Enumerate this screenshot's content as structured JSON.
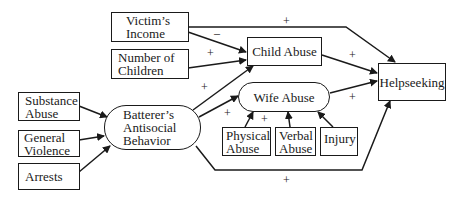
{
  "diagram": {
    "type": "path-model",
    "nodes": {
      "victims_income": {
        "line1": "Victim’s",
        "line2": "Income"
      },
      "number_of_children": {
        "line1": "Number of",
        "line2": "Children"
      },
      "child_abuse": {
        "label": "Child Abuse"
      },
      "helpseeking": {
        "label": "Helpseeking"
      },
      "wife_abuse": {
        "label": "Wife Abuse"
      },
      "substance_abuse": {
        "line1": "Substance",
        "line2": "Abuse"
      },
      "general_violence": {
        "line1": "General",
        "line2": "Violence"
      },
      "arrests": {
        "label": "Arrests"
      },
      "batterers_antisocial_behavior": {
        "line1": "Batterer’s",
        "line2": "Antisocial",
        "line3": "Behavior"
      },
      "physical_abuse": {
        "line1": "Physical",
        "line2": "Abuse"
      },
      "verbal_abuse": {
        "line1": "Verbal",
        "line2": "Abuse"
      },
      "injury": {
        "label": "Injury"
      }
    },
    "edges": [
      {
        "from": "Victim's Income",
        "to": "Helpseeking",
        "sign": "+"
      },
      {
        "from": "Victim's Income",
        "to": "Child Abuse",
        "sign": "–"
      },
      {
        "from": "Number of Children",
        "to": "Child Abuse",
        "sign": "+"
      },
      {
        "from": "Batterer's Antisocial Behavior",
        "to": "Child Abuse",
        "sign": "+"
      },
      {
        "from": "Batterer's Antisocial Behavior",
        "to": "Wife Abuse",
        "sign": "+"
      },
      {
        "from": "Batterer's Antisocial Behavior",
        "to": "Helpseeking",
        "sign": "+"
      },
      {
        "from": "Child Abuse",
        "to": "Helpseeking",
        "sign": "+"
      },
      {
        "from": "Wife Abuse",
        "to": "Helpseeking",
        "sign": "+"
      },
      {
        "from": "Substance Abuse",
        "to": "Batterer's Antisocial Behavior",
        "sign": ""
      },
      {
        "from": "General Violence",
        "to": "Batterer's Antisocial Behavior",
        "sign": ""
      },
      {
        "from": "Arrests",
        "to": "Batterer's Antisocial Behavior",
        "sign": ""
      },
      {
        "from": "Physical Abuse",
        "to": "Wife Abuse",
        "sign": "+"
      },
      {
        "from": "Verbal Abuse",
        "to": "Wife Abuse",
        "sign": ""
      },
      {
        "from": "Injury",
        "to": "Wife Abuse",
        "sign": ""
      }
    ],
    "signs": {
      "income_help": "+",
      "income_child": "–",
      "children_child": "+",
      "abb_child": "+",
      "abb_wife": "+",
      "child_help": "+",
      "wife_help": "+",
      "physical_wife": "+",
      "abb_help": "+"
    }
  }
}
